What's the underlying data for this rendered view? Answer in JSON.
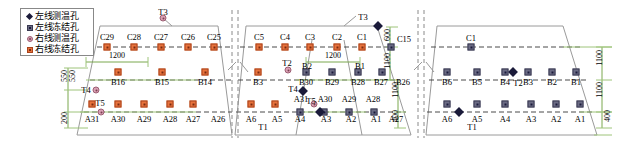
{
  "legend": {
    "items": [
      {
        "symbol": "black-diamond",
        "label": "左线测温孔",
        "marker": "mk-ltd"
      },
      {
        "symbol": "grey-square",
        "label": "左线冻结孔",
        "marker": "mk-lfz"
      },
      {
        "symbol": "pink-circle",
        "label": "右线测温孔",
        "marker": "mk-rtd"
      },
      {
        "symbol": "orange-square",
        "label": "右线冻结孔",
        "marker": "mk-rfz"
      }
    ]
  },
  "panels": {
    "left": {
      "top_row": [
        "C29",
        "C28",
        "C27",
        "C26",
        "C25"
      ],
      "mid_row": [
        "B16",
        "B15",
        "B14"
      ],
      "bot_row": [
        "A31",
        "A30",
        "A29",
        "A28",
        "A27",
        "A26"
      ],
      "temp_labels": [
        "T3",
        "T4",
        "T5"
      ],
      "h_dim": "1200",
      "v_dims": [
        "550",
        "550",
        "200"
      ]
    },
    "middle": {
      "top_row": [
        "C5",
        "C4",
        "C3",
        "C2",
        "C1"
      ],
      "mid_row": [
        "B3",
        "B30",
        "B29",
        "B28",
        "B27",
        "B26",
        "B2",
        "B1"
      ],
      "bot_row": [
        "A6",
        "A5",
        "A4",
        "A3",
        "A2",
        "A1",
        "A31",
        "A30",
        "A29",
        "A28",
        "A27"
      ],
      "temp_labels": [
        "T3",
        "T2",
        "T4",
        "T5",
        "T1"
      ],
      "h_dim": "1200",
      "v_dims": [
        "600",
        "1100",
        "1100",
        "400"
      ],
      "node_C15": "C15"
    },
    "right": {
      "top_row": [
        "C1"
      ],
      "mid_row": [
        "B6",
        "B5",
        "B4",
        "B3",
        "B2",
        "B1"
      ],
      "bot_row": [
        "A6",
        "A5",
        "A4",
        "A3",
        "A2",
        "A1"
      ],
      "temp_labels": [
        "T2",
        "T1"
      ],
      "v_dims": [
        "1100",
        "1100",
        "400"
      ]
    }
  },
  "dims": {
    "d1200_a": "1200",
    "d1200_b": "1200",
    "d600": "600",
    "d1100_a": "1100",
    "d1100_b": "1100",
    "d1100_c": "1100",
    "d1100_d": "1100",
    "d400_a": "400",
    "d400_b": "400",
    "d550_a": "550",
    "d550_b": "550",
    "d200": "200"
  }
}
